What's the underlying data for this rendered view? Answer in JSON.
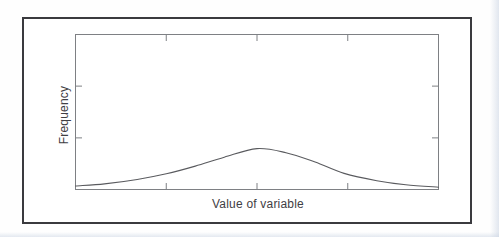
{
  "figure": {
    "xlabel": "Value of variable",
    "ylabel": "Frequency"
  },
  "chart_data": {
    "type": "line",
    "title": "",
    "xlabel": "Value of variable",
    "ylabel": "Frequency",
    "grid": false,
    "legend": null,
    "x_axis": {
      "tick_labels": [],
      "tick_positions_frac": [
        0.25,
        0.5,
        0.75
      ],
      "ticks_on": [
        "top",
        "bottom"
      ]
    },
    "y_axis": {
      "tick_labels": [],
      "tick_positions_frac": [
        0.333,
        0.667
      ],
      "ticks_on": [
        "left",
        "right"
      ]
    },
    "series": [
      {
        "name": "frequency-distribution-curve",
        "points": [
          [
            0.0,
            0.08
          ],
          [
            0.08,
            0.13
          ],
          [
            0.17,
            0.24
          ],
          [
            0.25,
            0.38
          ],
          [
            0.33,
            0.57
          ],
          [
            0.41,
            0.79
          ],
          [
            0.5,
            1.0
          ],
          [
            0.58,
            0.9
          ],
          [
            0.66,
            0.67
          ],
          [
            0.74,
            0.39
          ],
          [
            0.83,
            0.21
          ],
          [
            0.91,
            0.11
          ],
          [
            1.0,
            0.05
          ]
        ],
        "peak_height_frac_of_plot": 0.26
      }
    ]
  },
  "colors": {
    "outer_frame": "#3a3a3e",
    "plot_box": "#7e8084",
    "tick": "#7e8084",
    "curve": "#5a5b5f",
    "text": "#3f4044",
    "page_edge": "#c9d3e2",
    "background": "#fefefe"
  }
}
